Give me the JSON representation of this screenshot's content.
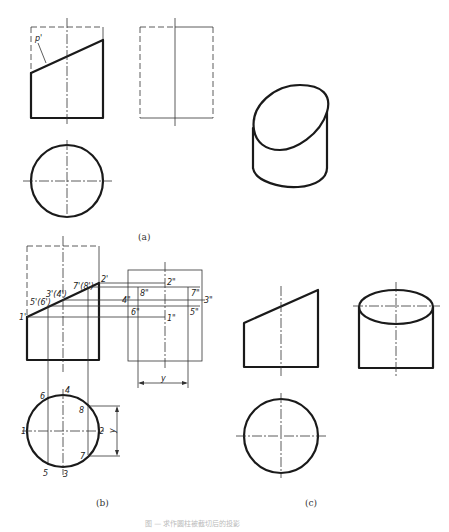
{
  "figure": {
    "caption": "图 — 求作圆柱被截切后的投影",
    "panels": [
      {
        "id": "a",
        "label": "(a)",
        "views": [
          "front-view",
          "side-view-dashed",
          "top-view-circle",
          "isometric-truncated-cylinder"
        ],
        "annotations": [
          "p'"
        ]
      },
      {
        "id": "b",
        "label": "(b)",
        "front_points": [
          "1'",
          "5'(6')",
          "3'(4')",
          "7'(8')",
          "2'"
        ],
        "side_points": [
          "2\"",
          "4\"",
          "8\"",
          "7\"",
          "3\"",
          "6\"",
          "1\"",
          "5\""
        ],
        "top_points": [
          "1",
          "2",
          "3",
          "4",
          "5",
          "6",
          "7",
          "8"
        ],
        "dimension": "y"
      },
      {
        "id": "c",
        "label": "(c)",
        "views": [
          "front-view",
          "side-view-with-ellipse",
          "top-view-circle"
        ]
      }
    ]
  },
  "labels": {
    "a": "(a)",
    "b": "(b)",
    "c": "(c)",
    "p_prime": "p'",
    "b_front": {
      "p1": "1'",
      "p56": "5'(6')",
      "p34": "3'(4')",
      "p78": "7'(8')",
      "p2": "2'"
    },
    "b_side": {
      "p2": "2\"",
      "p4": "4\"",
      "p8": "8\"",
      "p7": "7\"",
      "p3": "3\"",
      "p6": "6\"",
      "p1": "1\"",
      "p5": "5\""
    },
    "b_top": {
      "p1": "1",
      "p2": "2",
      "p3": "3",
      "p4": "4",
      "p5": "5",
      "p6": "6",
      "p7": "7",
      "p8": "8"
    },
    "dim_y": "y"
  }
}
